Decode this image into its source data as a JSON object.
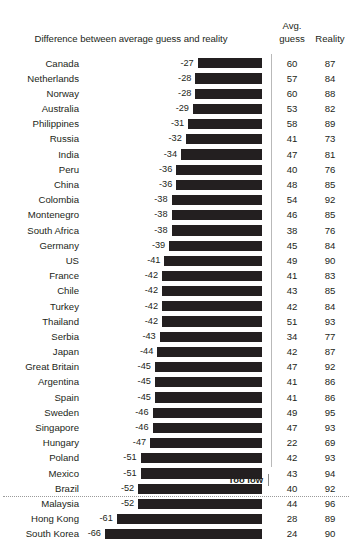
{
  "header": {
    "title": "Difference between average guess and reality",
    "avg_line1": "Avg.",
    "avg_line2": "guess",
    "reality": "Reality"
  },
  "footer": {
    "too_low": "Too low"
  },
  "axis": {
    "bar_right_px": 262,
    "px_per_unit": 2.38
  },
  "chart_data": {
    "type": "bar",
    "orientation": "horizontal",
    "title": "Difference between average guess and reality",
    "xlabel": "",
    "ylabel": "",
    "xlim": [
      -66,
      0
    ],
    "grid": false,
    "legend": false,
    "annotations": [
      "Too low"
    ],
    "columns": [
      "Country",
      "Difference between average guess and reality",
      "Avg. guess",
      "Reality"
    ],
    "categories": [
      "Canada",
      "Netherlands",
      "Norway",
      "Australia",
      "Philippines",
      "Russia",
      "India",
      "Peru",
      "China",
      "Colombia",
      "Montenegro",
      "South Africa",
      "Germany",
      "US",
      "France",
      "Chile",
      "Turkey",
      "Thailand",
      "Serbia",
      "Japan",
      "Great Britain",
      "Argentina",
      "Spain",
      "Sweden",
      "Singapore",
      "Hungary",
      "Poland",
      "Mexico",
      "Brazil",
      "Malaysia",
      "Hong Kong",
      "South Korea"
    ],
    "values": [
      -27,
      -28,
      -28,
      -29,
      -31,
      -32,
      -34,
      -36,
      -36,
      -38,
      -38,
      -38,
      -39,
      -41,
      -42,
      -42,
      -42,
      -42,
      -43,
      -44,
      -45,
      -45,
      -45,
      -46,
      -46,
      -47,
      -51,
      -51,
      -52,
      -52,
      -61,
      -66
    ],
    "series": [
      {
        "name": "Avg. guess",
        "values": [
          60,
          57,
          60,
          53,
          58,
          41,
          47,
          40,
          48,
          54,
          46,
          38,
          45,
          49,
          41,
          43,
          42,
          51,
          34,
          42,
          47,
          41,
          41,
          49,
          47,
          22,
          42,
          43,
          40,
          44,
          28,
          24
        ]
      },
      {
        "name": "Reality",
        "values": [
          87,
          84,
          88,
          82,
          89,
          73,
          81,
          76,
          85,
          92,
          85,
          76,
          84,
          90,
          83,
          85,
          84,
          93,
          77,
          87,
          92,
          86,
          86,
          95,
          93,
          69,
          93,
          94,
          92,
          96,
          89,
          90
        ]
      }
    ]
  },
  "rows": [
    {
      "country": "Canada",
      "diff": "-27",
      "value": -27,
      "avg": "60",
      "reality": "87"
    },
    {
      "country": "Netherlands",
      "diff": "-28",
      "value": -28,
      "avg": "57",
      "reality": "84"
    },
    {
      "country": "Norway",
      "diff": "-28",
      "value": -28,
      "avg": "60",
      "reality": "88"
    },
    {
      "country": "Australia",
      "diff": "-29",
      "value": -29,
      "avg": "53",
      "reality": "82"
    },
    {
      "country": "Philippines",
      "diff": "-31",
      "value": -31,
      "avg": "58",
      "reality": "89"
    },
    {
      "country": "Russia",
      "diff": "-32",
      "value": -32,
      "avg": "41",
      "reality": "73"
    },
    {
      "country": "India",
      "diff": "-34",
      "value": -34,
      "avg": "47",
      "reality": "81"
    },
    {
      "country": "Peru",
      "diff": "-36",
      "value": -36,
      "avg": "40",
      "reality": "76"
    },
    {
      "country": "China",
      "diff": "-36",
      "value": -36,
      "avg": "48",
      "reality": "85"
    },
    {
      "country": "Colombia",
      "diff": "-38",
      "value": -38,
      "avg": "54",
      "reality": "92"
    },
    {
      "country": "Montenegro",
      "diff": "-38",
      "value": -38,
      "avg": "46",
      "reality": "85"
    },
    {
      "country": "South Africa",
      "diff": "-38",
      "value": -38,
      "avg": "38",
      "reality": "76"
    },
    {
      "country": "Germany",
      "diff": "-39",
      "value": -39,
      "avg": "45",
      "reality": "84"
    },
    {
      "country": "US",
      "diff": "-41",
      "value": -41,
      "avg": "49",
      "reality": "90"
    },
    {
      "country": "France",
      "diff": "-42",
      "value": -42,
      "avg": "41",
      "reality": "83"
    },
    {
      "country": "Chile",
      "diff": "-42",
      "value": -42,
      "avg": "43",
      "reality": "85"
    },
    {
      "country": "Turkey",
      "diff": "-42",
      "value": -42,
      "avg": "42",
      "reality": "84"
    },
    {
      "country": "Thailand",
      "diff": "-42",
      "value": -42,
      "avg": "51",
      "reality": "93"
    },
    {
      "country": "Serbia",
      "diff": "-43",
      "value": -43,
      "avg": "34",
      "reality": "77"
    },
    {
      "country": "Japan",
      "diff": "-44",
      "value": -44,
      "avg": "42",
      "reality": "87"
    },
    {
      "country": "Great Britain",
      "diff": "-45",
      "value": -45,
      "avg": "47",
      "reality": "92"
    },
    {
      "country": "Argentina",
      "diff": "-45",
      "value": -45,
      "avg": "41",
      "reality": "86"
    },
    {
      "country": "Spain",
      "diff": "-45",
      "value": -45,
      "avg": "41",
      "reality": "86"
    },
    {
      "country": "Sweden",
      "diff": "-46",
      "value": -46,
      "avg": "49",
      "reality": "95"
    },
    {
      "country": "Singapore",
      "diff": "-46",
      "value": -46,
      "avg": "47",
      "reality": "93"
    },
    {
      "country": "Hungary",
      "diff": "-47",
      "value": -47,
      "avg": "22",
      "reality": "69"
    },
    {
      "country": "Poland",
      "diff": "-51",
      "value": -51,
      "avg": "42",
      "reality": "93"
    },
    {
      "country": "Mexico",
      "diff": "-51",
      "value": -51,
      "avg": "43",
      "reality": "94"
    },
    {
      "country": "Brazil",
      "diff": "-52",
      "value": -52,
      "avg": "40",
      "reality": "92"
    },
    {
      "country": "Malaysia",
      "diff": "-52",
      "value": -52,
      "avg": "44",
      "reality": "96"
    },
    {
      "country": "Hong Kong",
      "diff": "-61",
      "value": -61,
      "avg": "28",
      "reality": "89"
    },
    {
      "country": "South Korea",
      "diff": "-66",
      "value": -66,
      "avg": "24",
      "reality": "90"
    }
  ],
  "colors": {
    "bar": "#231f20",
    "text": "#231f20",
    "divider": "#b9b9b9",
    "rule": "#9a9a9a",
    "background": "#ffffff"
  }
}
